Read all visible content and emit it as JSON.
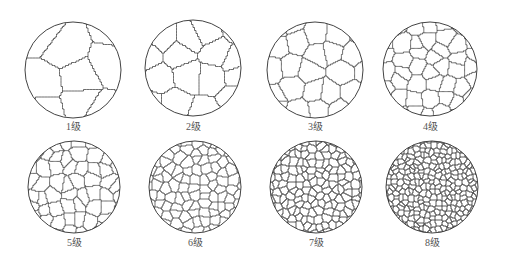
{
  "figure": {
    "background": "#ffffff",
    "line_color": "#2e2e2e",
    "label_color": "#555555",
    "panels": [
      {
        "grade": 1,
        "label": "1级",
        "cx": 73,
        "cy": 70,
        "r": 48,
        "label_y": 121
      },
      {
        "grade": 2,
        "label": "2级",
        "cx": 193,
        "cy": 68,
        "r": 48,
        "label_y": 121
      },
      {
        "grade": 3,
        "label": "3级",
        "cx": 315,
        "cy": 70,
        "r": 48,
        "label_y": 121
      },
      {
        "grade": 4,
        "label": "4级",
        "cx": 430,
        "cy": 69,
        "r": 47,
        "label_y": 121
      },
      {
        "grade": 5,
        "label": "5级",
        "cx": 74,
        "cy": 187,
        "r": 46,
        "label_y": 237
      },
      {
        "grade": 6,
        "label": "6级",
        "cx": 195,
        "cy": 187,
        "r": 46,
        "label_y": 237
      },
      {
        "grade": 7,
        "label": "7级",
        "cx": 316,
        "cy": 187,
        "r": 46,
        "label_y": 237
      },
      {
        "grade": 8,
        "label": "8级",
        "cx": 432,
        "cy": 187,
        "r": 46,
        "label_y": 237
      }
    ],
    "grain_seed_counts": {
      "1": 7,
      "2": 10,
      "3": 18,
      "4": 30,
      "5": 48,
      "6": 80,
      "7": 150,
      "8": 260
    }
  }
}
